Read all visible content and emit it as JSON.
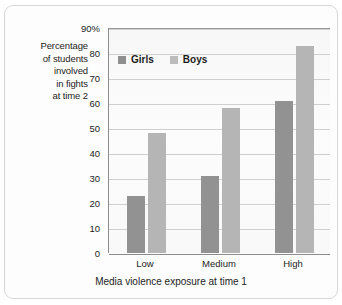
{
  "chart_data": {
    "type": "bar",
    "title": "",
    "subtitle": "",
    "categories": [
      "Low",
      "Medium",
      "High"
    ],
    "series": [
      {
        "name": "Girls",
        "values": [
          23,
          31,
          61
        ],
        "color": "#929292"
      },
      {
        "name": "Boys",
        "values": [
          48,
          58,
          83
        ],
        "color": "#b5b5b5"
      }
    ],
    "xlabel": "Media violence exposure at time 1",
    "ylabel": "Percentage of students involved in fights at time 2",
    "ylabel_lines": [
      "Percentage",
      "of students",
      "involved",
      "in fights",
      "at time 2"
    ],
    "ylim": [
      0,
      90
    ],
    "yticks": [
      {
        "value": 90,
        "label": "90%"
      },
      {
        "value": 80,
        "label": "80"
      },
      {
        "value": 70,
        "label": "70"
      },
      {
        "value": 60,
        "label": "60"
      },
      {
        "value": 50,
        "label": "50"
      },
      {
        "value": 40,
        "label": "40"
      },
      {
        "value": 30,
        "label": "30"
      },
      {
        "value": 20,
        "label": "20"
      },
      {
        "value": 10,
        "label": "10"
      },
      {
        "value": 0,
        "label": "0"
      }
    ],
    "grid": true,
    "grid_axis": "y",
    "legend_position": "top-left-inside",
    "legend": [
      "Girls",
      "Boys"
    ],
    "units": "percent"
  },
  "colors": {
    "girls_bar": "#929292",
    "boys_bar": "#b5b5b5",
    "gridline": "#cfcfcf",
    "axis": "#8c8c8c",
    "text": "#1c1c1c",
    "frame_border": "#d7d7d7",
    "plot_background": "#fafafa"
  }
}
